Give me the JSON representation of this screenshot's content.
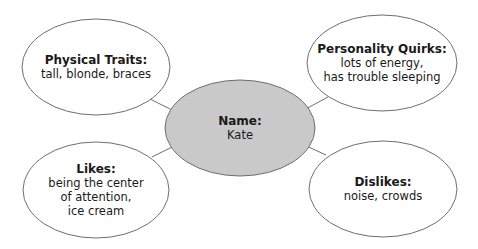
{
  "diagram": {
    "type": "character-web",
    "colors": {
      "center_fill": "#c9c9c9",
      "outer_fill": "#ffffff",
      "stroke": "#6e6e6e",
      "text": "#1a1a1a"
    },
    "center": {
      "title": "Name:",
      "lines": [
        "Kate"
      ]
    },
    "nodes": [
      {
        "id": "physical-traits",
        "title": "Physical Traits:",
        "lines": [
          "tall, blonde, braces"
        ]
      },
      {
        "id": "personality-quirks",
        "title": "Personality Quirks:",
        "lines": [
          "lots of energy,",
          "has trouble sleeping"
        ]
      },
      {
        "id": "likes",
        "title": "Likes:",
        "lines": [
          "being the center",
          "of attention,",
          "ice cream"
        ]
      },
      {
        "id": "dislikes",
        "title": "Dislikes:",
        "lines": [
          "noise, crowds"
        ]
      }
    ]
  }
}
